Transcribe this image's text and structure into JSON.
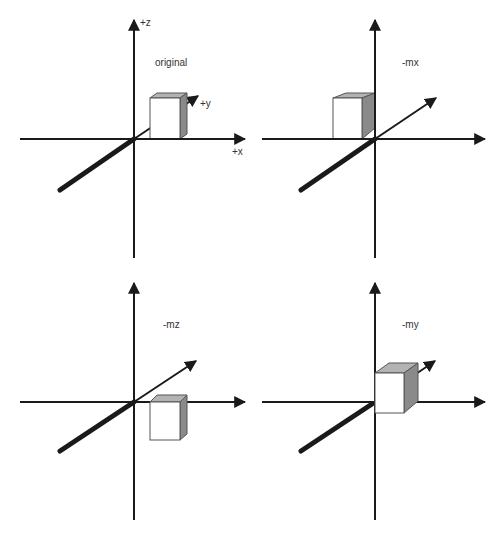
{
  "figure": {
    "panels": [
      {
        "id": "original",
        "title": "original",
        "axis_labels": {
          "z": "+z",
          "y": "+y",
          "x": "+x"
        }
      },
      {
        "id": "mx",
        "title": "-mx"
      },
      {
        "id": "mz",
        "title": "-mz"
      },
      {
        "id": "my",
        "title": "-my"
      }
    ]
  },
  "colors": {
    "axis": "#1a1a1a",
    "cube_front": "#ffffff",
    "cube_side": "#8a8a8a",
    "cube_top": "#b3b3b3",
    "label": "#333333"
  }
}
